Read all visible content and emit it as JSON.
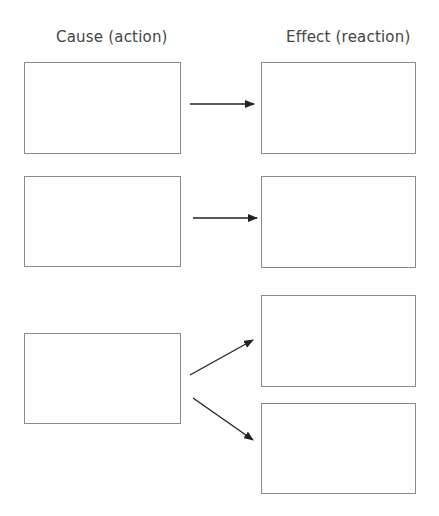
{
  "headings": {
    "cause": "Cause (action)",
    "effect": "Effect (reaction)"
  },
  "colors": {
    "box_border": "#8a8a8a",
    "arrow": "#222222",
    "text": "#444444"
  },
  "rows": [
    {
      "cause_box": "",
      "effect_boxes": [
        ""
      ]
    },
    {
      "cause_box": "",
      "effect_boxes": [
        ""
      ]
    },
    {
      "cause_box": "",
      "effect_boxes": [
        "",
        ""
      ]
    }
  ]
}
